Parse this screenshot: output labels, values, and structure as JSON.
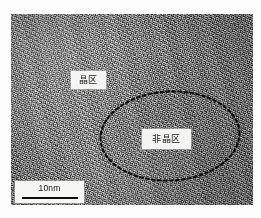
{
  "figure": {
    "kind": "tem-micrograph",
    "background_color": "#ffffff",
    "frame": {
      "left": 11,
      "top": 14,
      "width": 242,
      "height": 191,
      "base_gray": "#8a8a8a"
    },
    "annotations": {
      "crystalline_label": {
        "text": "晶区",
        "box_color": "#f4f4f2",
        "text_color": "#1a1a1a"
      },
      "amorphous_label": {
        "text": "非晶区",
        "box_color": "#f4f4f2",
        "text_color": "#1a1a1a"
      },
      "region_outline": {
        "shape": "ellipse",
        "style": "dashed",
        "color": "#101010",
        "dash_pattern": "3 3",
        "stroke_width": 2.1,
        "center_x": 73,
        "center_y": 50,
        "radius_x": 70,
        "radius_y": 45
      }
    },
    "scale_bar": {
      "label": "10nm",
      "bar_color": "#0d0d0d",
      "box_color": "#f6f6f4",
      "text_color": "#141414"
    }
  }
}
